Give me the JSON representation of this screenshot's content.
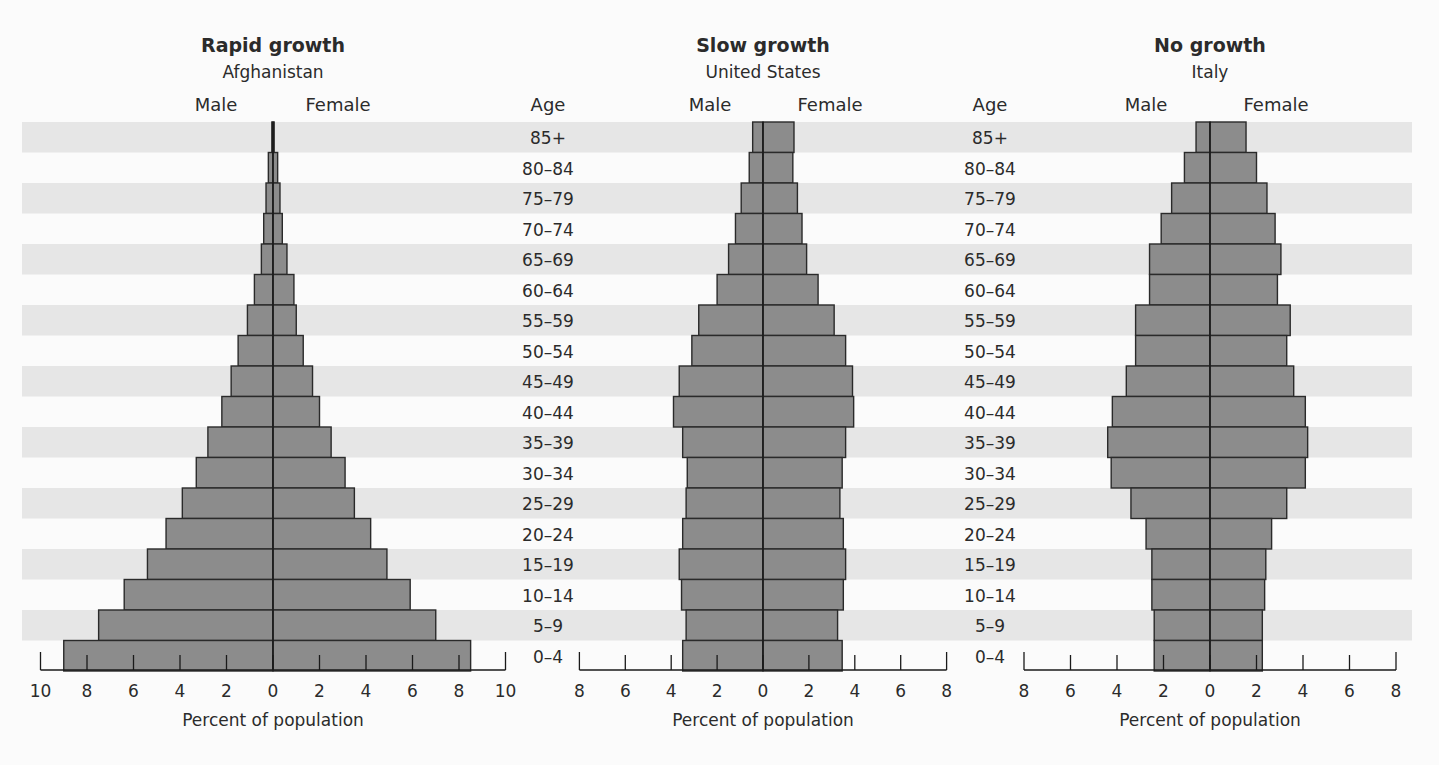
{
  "chart_data": [
    {
      "type": "bar",
      "orientation": "horizontal-population-pyramid",
      "title": "Rapid growth",
      "subtitle": "Afghanistan",
      "left_label": "Male",
      "right_label": "Female",
      "xlabel": "Percent of population",
      "ylabel": "Age",
      "xlim": [
        -10,
        10
      ],
      "xticks": [
        10,
        8,
        6,
        4,
        2,
        0,
        2,
        4,
        6,
        8,
        10
      ],
      "categories": [
        "85+",
        "80–84",
        "75–79",
        "70–74",
        "65–69",
        "60–64",
        "55–59",
        "50–54",
        "45–49",
        "40–44",
        "35–39",
        "30–34",
        "25–29",
        "20–24",
        "15–19",
        "10–14",
        "5–9",
        "0–4"
      ],
      "series": [
        {
          "name": "Male",
          "values": [
            0.05,
            0.2,
            0.3,
            0.4,
            0.5,
            0.8,
            1.1,
            1.5,
            1.8,
            2.2,
            2.8,
            3.3,
            3.9,
            4.6,
            5.4,
            6.4,
            7.5,
            9.0
          ]
        },
        {
          "name": "Female",
          "values": [
            0.05,
            0.2,
            0.3,
            0.4,
            0.6,
            0.9,
            1.0,
            1.3,
            1.7,
            2.0,
            2.5,
            3.1,
            3.5,
            4.2,
            4.9,
            5.9,
            7.0,
            8.5
          ]
        }
      ]
    },
    {
      "type": "bar",
      "orientation": "horizontal-population-pyramid",
      "title": "Slow growth",
      "subtitle": "United States",
      "left_label": "Male",
      "right_label": "Female",
      "xlabel": "Percent of population",
      "ylabel": "Age",
      "xlim": [
        -8,
        8
      ],
      "xticks": [
        8,
        6,
        4,
        2,
        0,
        2,
        4,
        6,
        8
      ],
      "categories": [
        "85+",
        "80–84",
        "75–79",
        "70–74",
        "65–69",
        "60–64",
        "55–59",
        "50–54",
        "45–49",
        "40–44",
        "35–39",
        "30–34",
        "25–29",
        "20–24",
        "15–19",
        "10–14",
        "5–9",
        "0–4"
      ],
      "series": [
        {
          "name": "Male",
          "values": [
            0.45,
            0.6,
            0.95,
            1.2,
            1.5,
            2.0,
            2.8,
            3.1,
            3.65,
            3.9,
            3.5,
            3.3,
            3.35,
            3.5,
            3.65,
            3.55,
            3.35,
            3.5
          ]
        },
        {
          "name": "Female",
          "values": [
            1.35,
            1.3,
            1.5,
            1.7,
            1.9,
            2.4,
            3.1,
            3.6,
            3.9,
            3.95,
            3.6,
            3.45,
            3.35,
            3.5,
            3.6,
            3.5,
            3.25,
            3.45
          ]
        }
      ]
    },
    {
      "type": "bar",
      "orientation": "horizontal-population-pyramid",
      "title": "No growth",
      "subtitle": "Italy",
      "left_label": "Male",
      "right_label": "Female",
      "xlabel": "Percent of population",
      "ylabel": "Age",
      "xlim": [
        -8,
        8
      ],
      "xticks": [
        8,
        6,
        4,
        2,
        0,
        2,
        4,
        6,
        8
      ],
      "categories": [
        "85+",
        "80–84",
        "75–79",
        "70–74",
        "65–69",
        "60–64",
        "55–59",
        "50–54",
        "45–49",
        "40–44",
        "35–39",
        "30–34",
        "25–29",
        "20–24",
        "15–19",
        "10–14",
        "5–9",
        "0–4"
      ],
      "series": [
        {
          "name": "Male",
          "values": [
            0.6,
            1.1,
            1.65,
            2.1,
            2.6,
            2.6,
            3.2,
            3.2,
            3.6,
            4.2,
            4.4,
            4.25,
            3.4,
            2.75,
            2.5,
            2.5,
            2.4,
            2.4
          ]
        },
        {
          "name": "Female",
          "values": [
            1.55,
            2.0,
            2.45,
            2.8,
            3.05,
            2.9,
            3.45,
            3.3,
            3.6,
            4.1,
            4.2,
            4.1,
            3.3,
            2.65,
            2.4,
            2.35,
            2.25,
            2.25
          ]
        }
      ]
    }
  ],
  "age_axis_label": "Age",
  "colors": {
    "bar_fill": "#8c8c8c",
    "bar_stroke": "#2a2a2a",
    "band": "#e6e6e6",
    "background": "#fbfbfb",
    "text": "#2b2b2b"
  }
}
